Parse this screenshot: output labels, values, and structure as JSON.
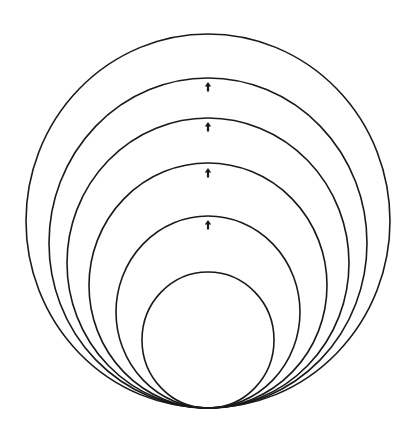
{
  "diagram": {
    "type": "nested-tangent-circles",
    "stroke_color": "#1a1a1a",
    "background": "#ffffff",
    "tangent_point": {
      "x": 208,
      "y": 408
    },
    "circles": [
      {
        "id": "circle-1",
        "cx": 208,
        "cy": 221,
        "rx": 182,
        "ry": 187
      },
      {
        "id": "circle-2",
        "cx": 208,
        "cy": 243,
        "rx": 159,
        "ry": 165
      },
      {
        "id": "circle-3",
        "cx": 208,
        "cy": 263,
        "rx": 141,
        "ry": 145
      },
      {
        "id": "circle-4",
        "cx": 208,
        "cy": 285.5,
        "rx": 119,
        "ry": 122.5
      },
      {
        "id": "circle-5",
        "cx": 208,
        "cy": 312,
        "rx": 92,
        "ry": 96
      },
      {
        "id": "circle-6",
        "cx": 208,
        "cy": 340,
        "rx": 66,
        "ry": 68
      }
    ],
    "arrows": [
      {
        "id": "arrow-1",
        "x": 208,
        "y": 87,
        "direction": "up",
        "glyph": "up-arrow-icon"
      },
      {
        "id": "arrow-2",
        "x": 208,
        "y": 127,
        "direction": "up",
        "glyph": "up-arrow-icon"
      },
      {
        "id": "arrow-3",
        "x": 208,
        "y": 173,
        "direction": "up",
        "glyph": "up-arrow-icon"
      },
      {
        "id": "arrow-4",
        "x": 208,
        "y": 225,
        "direction": "up",
        "glyph": "up-arrow-icon"
      }
    ]
  }
}
